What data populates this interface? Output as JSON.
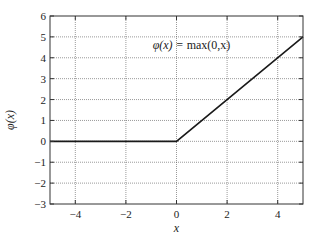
{
  "chart_data": {
    "type": "line",
    "title": "",
    "annotation": {
      "text_prefix": "φ(x) = ",
      "text_func": "max(0,x)",
      "x": 0.0,
      "y": 4.4
    },
    "xlabel": "x",
    "ylabel": "φ(x)",
    "xlim": [
      -5,
      5
    ],
    "ylim": [
      -3,
      6
    ],
    "xticks": [
      -4,
      -2,
      0,
      2,
      4
    ],
    "yticks": [
      -3,
      -2,
      -1,
      0,
      1,
      2,
      3,
      4,
      5,
      6
    ],
    "xtick_labels": [
      "−4",
      "−2",
      "0",
      "2",
      "4"
    ],
    "ytick_labels": [
      "−3",
      "−2",
      "−1",
      "0",
      "1",
      "2",
      "3",
      "4",
      "5",
      "6"
    ],
    "grid": true,
    "legend": null,
    "series": [
      {
        "name": "φ(x) = max(0,x)",
        "x": [
          -5,
          0,
          5
        ],
        "y": [
          0,
          0,
          5
        ],
        "color": "#1a1a1a"
      }
    ]
  },
  "layout": {
    "plot_left": 50,
    "plot_right": 303,
    "plot_top": 16,
    "plot_bottom": 204
  }
}
